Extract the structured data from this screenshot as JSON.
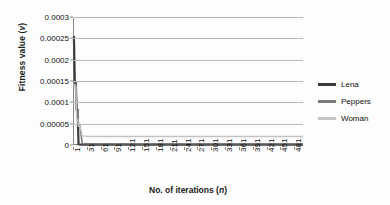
{
  "chart_data": {
    "type": "line",
    "title": "",
    "xlabel": "No. of iterations (n)",
    "xlabel_plain": "No. of iterations",
    "xlabel_italic": "n",
    "ylabel": "Fitness value (v)",
    "ylabel_plain": "Fitness value",
    "ylabel_italic": "v",
    "grid": true,
    "legend_position": "right",
    "xlim": [
      1,
      500
    ],
    "ylim": [
      0,
      0.0003
    ],
    "y_ticks": [
      0,
      5e-05,
      0.0001,
      0.00015,
      0.0002,
      0.00025,
      0.0003
    ],
    "y_tick_labels": [
      "0",
      "0.00005",
      "0.0001",
      "0.00015",
      "0.0002",
      "0.00025",
      "0.0003"
    ],
    "x_ticks": [
      1,
      31,
      61,
      91,
      121,
      151,
      181,
      211,
      241,
      271,
      301,
      331,
      361,
      391,
      421,
      451,
      481
    ],
    "x_tick_labels": [
      "1",
      "31",
      "61",
      "91",
      "121",
      "151",
      "181",
      "211",
      "241",
      "271",
      "301",
      "331",
      "361",
      "391",
      "421",
      "451",
      "481"
    ],
    "x": [
      1,
      3,
      5,
      7,
      9,
      11,
      13,
      16,
      21,
      31,
      61,
      121,
      181,
      241,
      301,
      361,
      421,
      481,
      500
    ],
    "series": [
      {
        "name": "Lena",
        "color": "#3c3c3c",
        "width": 2.2,
        "values": [
          0.000253,
          0.000253,
          0.000145,
          0.000145,
          8.2e-05,
          8.2e-05,
          1.5e-06,
          1.2e-06,
          1e-06,
          1e-06,
          1e-06,
          1e-06,
          1e-06,
          1e-06,
          1e-06,
          1e-06,
          1e-06,
          1e-06,
          1e-06
        ]
      },
      {
        "name": "Peppers",
        "color": "#7a7a7a",
        "width": 1.6,
        "values": [
          0.000147,
          0.000147,
          0.000143,
          0.000143,
          8e-05,
          8e-05,
          4.6e-05,
          4.6e-05,
          3.5e-06,
          3e-06,
          3e-06,
          3e-06,
          3e-06,
          3e-06,
          3e-06,
          3e-06,
          3e-06,
          3e-06,
          3e-06
        ]
      },
      {
        "name": "Woman",
        "color": "#c3c3c3",
        "width": 1.4,
        "values": [
          0.000141,
          0.000141,
          0.000138,
          0.000138,
          6e-05,
          6e-05,
          4.4e-05,
          4.4e-05,
          2.15e-05,
          2.05e-05,
          2e-05,
          2e-05,
          2e-05,
          2e-05,
          2e-05,
          2e-05,
          2e-05,
          2e-05,
          2e-05
        ]
      }
    ]
  },
  "legend": {
    "items": [
      {
        "label": "Lena",
        "color": "#3c3c3c"
      },
      {
        "label": "Peppers",
        "color": "#7a7a7a"
      },
      {
        "label": "Woman",
        "color": "#c3c3c3"
      }
    ]
  },
  "colors": {
    "gridline": "#b9b9b9",
    "axis": "#8a8a8a",
    "background": "#fdfdfd",
    "text": "#111111"
  }
}
